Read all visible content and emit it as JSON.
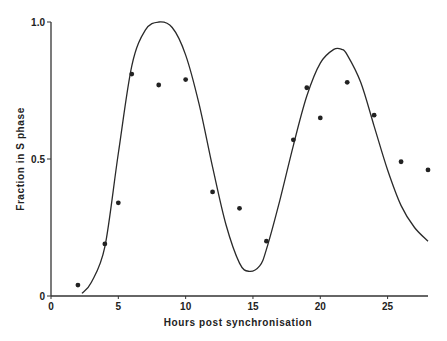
{
  "chart_data": {
    "type": "scatter",
    "title": "",
    "xlabel": "Hours post synchronisation",
    "ylabel": "Fraction in S phase",
    "xlim": [
      0,
      28
    ],
    "ylim": [
      0,
      1.0
    ],
    "grid": false,
    "legend": null,
    "x_ticks": [
      0,
      5,
      10,
      15,
      20,
      25
    ],
    "x_tick_labels": [
      "0",
      "5",
      "10",
      "15",
      "20",
      "25"
    ],
    "y_ticks": [
      0,
      0.5,
      1.0
    ],
    "y_tick_labels": [
      "0",
      "0.5",
      "1.0"
    ],
    "series": [
      {
        "name": "Observed",
        "type": "scatter",
        "x": [
          2,
          4,
          5,
          6,
          8,
          10,
          12,
          14,
          16,
          18,
          19,
          20,
          22,
          24,
          26,
          28
        ],
        "y": [
          0.04,
          0.19,
          0.34,
          0.81,
          0.77,
          0.79,
          0.38,
          0.32,
          0.2,
          0.57,
          0.76,
          0.65,
          0.78,
          0.66,
          0.49,
          0.46
        ]
      },
      {
        "name": "Model fit",
        "type": "line",
        "x": [
          2.3,
          3,
          4,
          5,
          6,
          7,
          8,
          9,
          10,
          11,
          12,
          13,
          14,
          14.7,
          15.5,
          16,
          17,
          18,
          19,
          20,
          21,
          21.6,
          22,
          23,
          24,
          25,
          26,
          27,
          28
        ],
        "y": [
          0.01,
          0.05,
          0.18,
          0.52,
          0.84,
          0.97,
          1.0,
          0.98,
          0.88,
          0.7,
          0.47,
          0.26,
          0.12,
          0.09,
          0.11,
          0.17,
          0.35,
          0.55,
          0.73,
          0.85,
          0.9,
          0.9,
          0.88,
          0.78,
          0.62,
          0.46,
          0.33,
          0.25,
          0.2
        ]
      }
    ]
  }
}
